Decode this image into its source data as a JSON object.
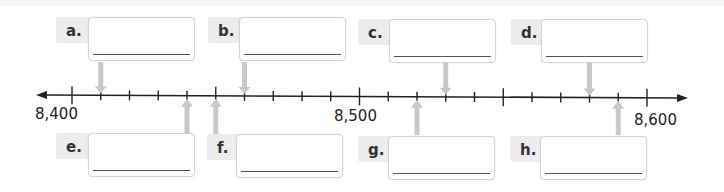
{
  "number_line": {
    "start": 8400,
    "end": 8600,
    "tick_step": 10,
    "major_every": 50,
    "labels": [
      {
        "value": 8400,
        "text": "8,400"
      },
      {
        "value": 8500,
        "text": "8,500"
      },
      {
        "value": 8600,
        "text": "8,600"
      }
    ]
  },
  "questions_top": [
    {
      "letter": "a.",
      "value": 8410,
      "answer": ""
    },
    {
      "letter": "b.",
      "value": 8460,
      "answer": ""
    },
    {
      "letter": "c.",
      "value": 8530,
      "answer": ""
    },
    {
      "letter": "d.",
      "value": 8580,
      "answer": ""
    }
  ],
  "questions_bottom": [
    {
      "letter": "e.",
      "value": 8440,
      "answer": ""
    },
    {
      "letter": "f.",
      "value": 8450,
      "answer": ""
    },
    {
      "letter": "g.",
      "value": 8520,
      "answer": ""
    },
    {
      "letter": "h.",
      "value": 8590,
      "answer": ""
    }
  ],
  "colors": {
    "line": "#222222",
    "arrow": "#c8c8c8"
  }
}
